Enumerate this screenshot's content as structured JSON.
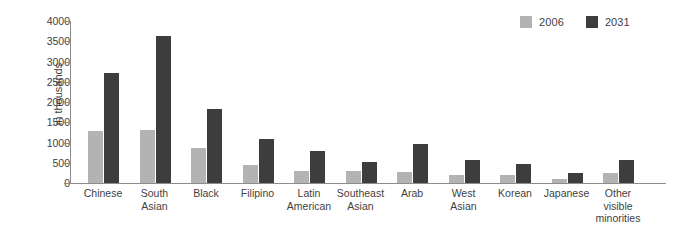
{
  "chart_data": {
    "type": "bar",
    "title": "",
    "xlabel": "",
    "ylabel": "in thousands",
    "ylim": [
      0,
      4000
    ],
    "yticks": [
      0,
      500,
      1000,
      1500,
      2000,
      2500,
      3000,
      3500,
      4000
    ],
    "ytick_labels": [
      "0",
      "500",
      "1000",
      "1500",
      "2000",
      "2500",
      "3000",
      "3500",
      "4000"
    ],
    "grid": false,
    "legend_position": "top-right",
    "categories": [
      "Chinese",
      "South Asian",
      "Black",
      "Filipino",
      "Latin American",
      "Southeast Asian",
      "Arab",
      "West Asian",
      "Korean",
      "Japanese",
      "Other visible minorities"
    ],
    "category_lines": [
      [
        "Chinese"
      ],
      [
        "South",
        "Asian"
      ],
      [
        "Black"
      ],
      [
        "Filipino"
      ],
      [
        "Latin",
        "American"
      ],
      [
        "Southeast",
        "Asian"
      ],
      [
        "Arab"
      ],
      [
        "West",
        "Asian"
      ],
      [
        "Korean"
      ],
      [
        "Japanese"
      ],
      [
        "Other",
        "visible",
        "minorities"
      ]
    ],
    "series": [
      {
        "name": "2006",
        "color": "#b3b3b3",
        "values": [
          1280,
          1300,
          860,
          440,
          300,
          300,
          280,
          200,
          200,
          100,
          250
        ]
      },
      {
        "name": "2031",
        "color": "#3d3d3d",
        "values": [
          2720,
          3620,
          1830,
          1080,
          790,
          510,
          970,
          560,
          470,
          250,
          580
        ]
      }
    ]
  },
  "legend": {
    "items": [
      {
        "label": "2006",
        "color": "#b3b3b3"
      },
      {
        "label": "2031",
        "color": "#3d3d3d"
      }
    ]
  },
  "axis": {
    "y_title": "in thousands"
  },
  "colors": {
    "series_2006": "#b3b3b3",
    "series_2031": "#3d3d3d",
    "axis": "#8d8d8d",
    "text": "#3f3f3f",
    "background": "#ffffff"
  }
}
